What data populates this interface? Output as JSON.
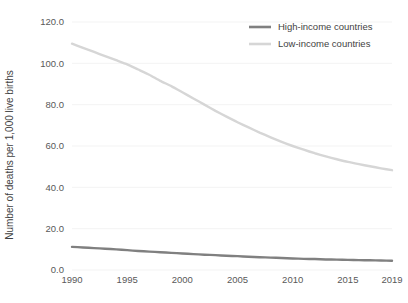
{
  "chart_data": {
    "type": "line",
    "title": "",
    "xlabel": "",
    "ylabel": "Number of deaths per 1,000 live births",
    "x": [
      1990,
      1991,
      1992,
      1993,
      1994,
      1995,
      1996,
      1997,
      1998,
      1999,
      2000,
      2001,
      2002,
      2003,
      2004,
      2005,
      2006,
      2007,
      2008,
      2009,
      2010,
      2011,
      2012,
      2013,
      2014,
      2015,
      2016,
      2017,
      2018,
      2019
    ],
    "xlim": [
      1990,
      2019
    ],
    "ylim": [
      0,
      120
    ],
    "xticks": [
      "1990",
      "1995",
      "2000",
      "2005",
      "2010",
      "2015",
      "2019"
    ],
    "xtick_values": [
      1990,
      1995,
      2000,
      2005,
      2010,
      2015,
      2019
    ],
    "yticks": [
      "0.0",
      "20.0",
      "40.0",
      "60.0",
      "80.0",
      "100.0",
      "120.0"
    ],
    "ytick_values": [
      0,
      20,
      40,
      60,
      80,
      100,
      120
    ],
    "grid": true,
    "legend_position": "top-right",
    "series": [
      {
        "name": "High-income countries",
        "color": "#808080",
        "width": 2.4,
        "values": [
          11.2,
          10.9,
          10.6,
          10.3,
          10.0,
          9.6,
          9.2,
          8.9,
          8.6,
          8.3,
          8.0,
          7.7,
          7.4,
          7.2,
          6.9,
          6.7,
          6.4,
          6.2,
          6.0,
          5.8,
          5.6,
          5.4,
          5.3,
          5.1,
          5.0,
          4.9,
          4.8,
          4.7,
          4.6,
          4.5
        ]
      },
      {
        "name": "Low-income countries",
        "color": "#d6d6d6",
        "width": 2.4,
        "values": [
          109.5,
          107.5,
          105.5,
          103.5,
          101.5,
          99.5,
          97.0,
          94.5,
          91.5,
          89.0,
          86.0,
          83.0,
          80.0,
          77.0,
          74.2,
          71.5,
          69.0,
          66.5,
          64.2,
          62.0,
          60.0,
          58.2,
          56.5,
          55.0,
          53.6,
          52.3,
          51.2,
          50.2,
          49.2,
          48.3
        ]
      }
    ]
  },
  "legend": {
    "items": [
      {
        "label": "High-income countries",
        "color": "#808080"
      },
      {
        "label": "Low-income countries",
        "color": "#d6d6d6"
      }
    ]
  },
  "axes": {
    "y_title": "Number of deaths per 1,000 live births"
  }
}
